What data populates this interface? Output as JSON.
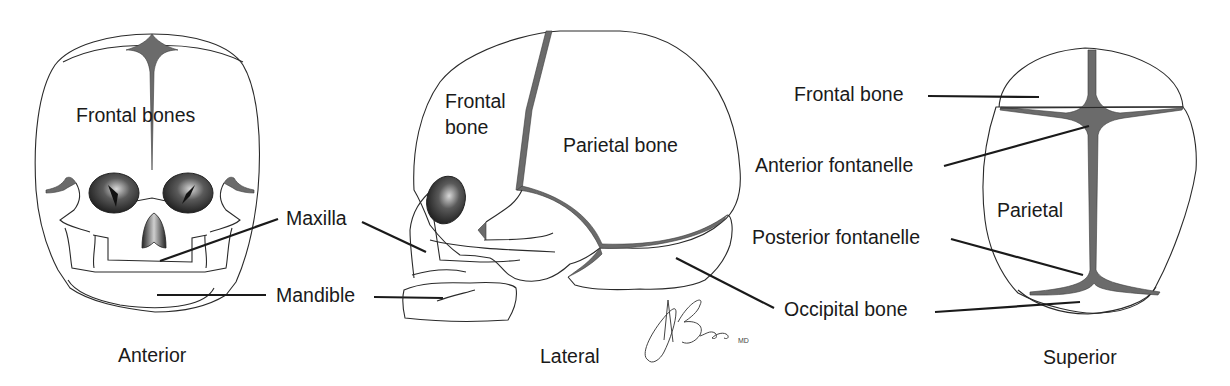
{
  "figure": {
    "views": [
      {
        "id": "anterior",
        "caption": "Anterior",
        "labels": {
          "frontal_bones": "Frontal bones"
        }
      },
      {
        "id": "lateral",
        "caption": "Lateral",
        "labels": {
          "frontal_bone_line1": "Frontal",
          "frontal_bone_line2": "bone",
          "parietal_bone": "Parietal bone"
        }
      },
      {
        "id": "superior",
        "caption": "Superior",
        "labels": {
          "parietal": "Parietal"
        }
      }
    ],
    "callouts": {
      "maxilla": "Maxilla",
      "mandible": "Mandible",
      "frontal_bone": "Frontal bone",
      "anterior_fontanelle": "Anterior fontanelle",
      "posterior_fontanelle": "Posterior fontanelle",
      "occipital_bone": "Occipital bone"
    },
    "signature": {
      "name": "ABrada",
      "suffix": "MD"
    },
    "colors": {
      "outline": "#2a2a2a",
      "suture_fill": "#6b6b6b",
      "orbit_fill": "#3a3a3a",
      "background": "#ffffff"
    }
  }
}
